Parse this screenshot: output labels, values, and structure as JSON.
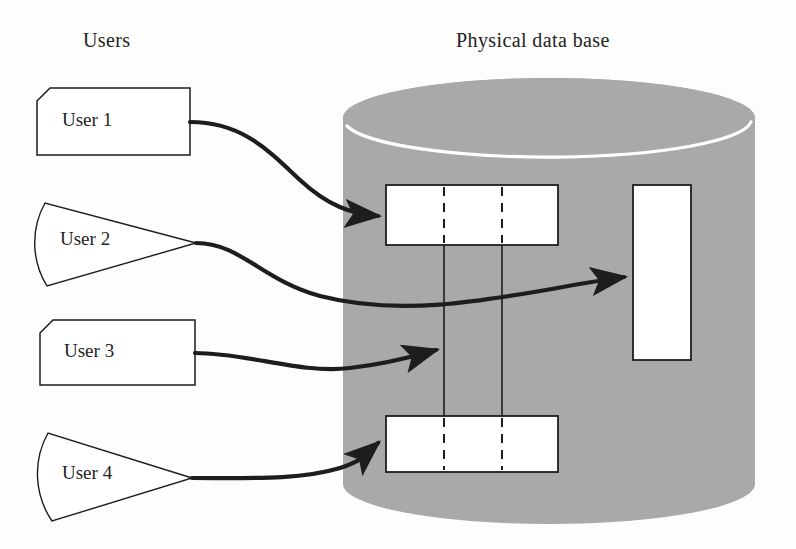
{
  "diagram": {
    "title_left": "Users",
    "title_right": "Physical data base",
    "colors": {
      "cylinder_fill": "#a9a9a9",
      "cylinder_highlight": "#ffffff",
      "stroke": "#1d1d1d",
      "record_fill": "#ffffff",
      "background": "#fdfdfc"
    },
    "users": [
      {
        "id": "user-1",
        "label": "User 1",
        "shape": "tag"
      },
      {
        "id": "user-2",
        "label": "User 2",
        "shape": "wedge"
      },
      {
        "id": "user-3",
        "label": "User 3",
        "shape": "tag"
      },
      {
        "id": "user-4",
        "label": "User 4",
        "shape": "wedge"
      }
    ],
    "database": {
      "shape": "cylinder",
      "records": [
        {
          "id": "record-top",
          "orientation": "horizontal",
          "segments": 3
        },
        {
          "id": "record-bottom",
          "orientation": "horizontal",
          "segments": 3
        },
        {
          "id": "record-vertical",
          "orientation": "vertical",
          "segments": 1
        }
      ],
      "link_lines": 2
    },
    "connections": [
      {
        "from": "user-1",
        "to": "record-top"
      },
      {
        "from": "user-2",
        "to": "record-vertical"
      },
      {
        "from": "user-3",
        "to": "link-line-1"
      },
      {
        "from": "user-4",
        "to": "record-bottom"
      }
    ]
  }
}
